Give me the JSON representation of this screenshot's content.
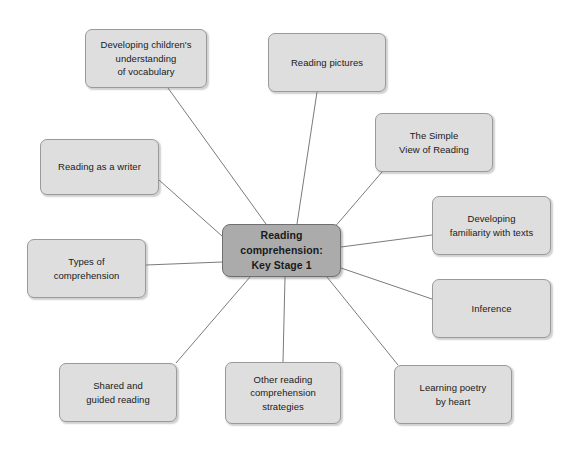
{
  "diagram": {
    "type": "mind-map",
    "title": "Reading comprehension: Key Stage 1",
    "center": {
      "id": "center",
      "label": "Reading\ncomprehension:\nKey Stage 1"
    },
    "colors": {
      "background": "#ffffff",
      "center_fill": "#ababab",
      "center_border": "#6f6f6f",
      "node_fill": "#dedede",
      "node_border": "#9a9a9a",
      "edge": "#6b6b6b",
      "text": "#1a1a1a"
    },
    "nodes": [
      {
        "id": "vocabulary",
        "label": "Developing children's\nunderstanding\nof vocabulary"
      },
      {
        "id": "pictures",
        "label": "Reading pictures"
      },
      {
        "id": "simple-view",
        "label": "The Simple\nView of Reading"
      },
      {
        "id": "familiarity",
        "label": "Developing\nfamiliarity with texts"
      },
      {
        "id": "inference",
        "label": "Inference"
      },
      {
        "id": "poetry",
        "label": "Learning poetry\nby heart"
      },
      {
        "id": "other-strategies",
        "label": "Other reading\ncomprehension\nstrategies"
      },
      {
        "id": "shared-guided",
        "label": "Shared and\nguided reading"
      },
      {
        "id": "types",
        "label": "Types of\ncomprehension"
      },
      {
        "id": "writer",
        "label": "Reading as a writer"
      }
    ],
    "edges": [
      {
        "from": "center",
        "to": "vocabulary"
      },
      {
        "from": "center",
        "to": "pictures"
      },
      {
        "from": "center",
        "to": "simple-view"
      },
      {
        "from": "center",
        "to": "familiarity"
      },
      {
        "from": "center",
        "to": "inference"
      },
      {
        "from": "center",
        "to": "poetry"
      },
      {
        "from": "center",
        "to": "other-strategies"
      },
      {
        "from": "center",
        "to": "shared-guided"
      },
      {
        "from": "center",
        "to": "types"
      },
      {
        "from": "center",
        "to": "writer"
      }
    ]
  }
}
